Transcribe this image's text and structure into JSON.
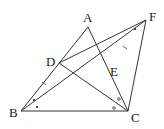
{
  "diagram": {
    "type": "geometry",
    "points": {
      "A": {
        "label": "A",
        "x": 88,
        "y": 27
      },
      "B": {
        "label": "B",
        "x": 21,
        "y": 111
      },
      "C": {
        "label": "C",
        "x": 128,
        "y": 111
      },
      "D": {
        "label": "D",
        "x": 59,
        "y": 63
      },
      "E": {
        "label": "E",
        "x": 107,
        "y": 66
      },
      "F": {
        "label": "F",
        "x": 146,
        "y": 20
      }
    },
    "segments": [
      "AB",
      "AC",
      "BC",
      "DC",
      "DF",
      "BF",
      "CF"
    ],
    "marks": {
      "equal_ticks": [
        "DB",
        "EF"
      ],
      "angle_dots": [
        "ABF",
        "FBC",
        "DFB"
      ],
      "angle_circles": [
        "DCA",
        "DCB"
      ]
    }
  }
}
